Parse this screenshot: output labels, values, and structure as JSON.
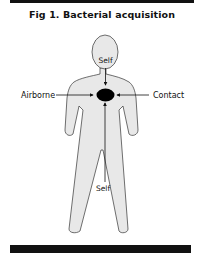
{
  "figure": {
    "title": "Fig 1. Bacterial acquisition",
    "labels": {
      "self_top": "Self",
      "airborne": "Airborne",
      "contact": "Contact",
      "self_bottom": "Self"
    },
    "colors": {
      "body_fill": "#e8e8e8",
      "outline": "#333333",
      "target": "#000000",
      "bars": "#111111"
    }
  }
}
